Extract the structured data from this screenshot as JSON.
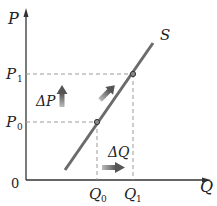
{
  "diagram": {
    "type": "supply-curve",
    "axes": {
      "y_label": "P",
      "x_label": "Q",
      "origin_label": "0"
    },
    "curve": {
      "label": "S",
      "color": "#6b6b6b"
    },
    "price_levels": [
      {
        "base": "P",
        "sub": "0"
      },
      {
        "base": "P",
        "sub": "1"
      }
    ],
    "quantity_levels": [
      {
        "base": "Q",
        "sub": "0"
      },
      {
        "base": "Q",
        "sub": "1"
      }
    ],
    "annotations": {
      "delta_p": "ΔP",
      "delta_q": "ΔQ"
    },
    "colors": {
      "axis": "#333333",
      "curve": "#6b6b6b",
      "dashed": "#9a9a9a",
      "arrow": "#777777",
      "point_fill": "#888888"
    }
  }
}
